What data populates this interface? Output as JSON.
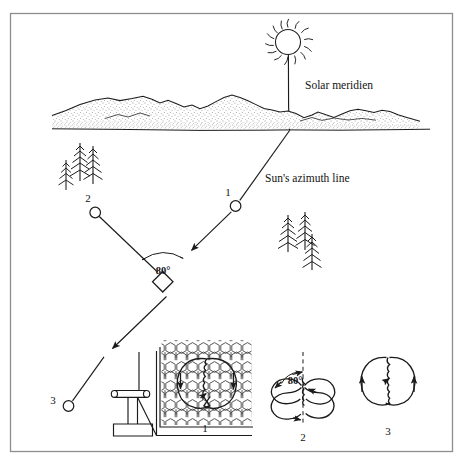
{
  "figure": {
    "title_text": "Solar meridien",
    "azimuth_text": "Sun's azimuth line",
    "angle_value": "80°",
    "border_color": "#8a8a8a",
    "ink_color": "#1b1b1b",
    "background_color": "#ffffff"
  },
  "annotations": {
    "solar_meridien": "Solar meridien",
    "suns_azimuth_line": "Sun's azimuth line",
    "angle_main": "80°",
    "angle_inset": "80°"
  },
  "stations": [
    {
      "id": "1",
      "label": "1"
    },
    {
      "id": "2",
      "label": "2"
    },
    {
      "id": "3",
      "label": "3"
    }
  ],
  "insets": [
    {
      "id": "inset-1",
      "label": "1",
      "caption": "1"
    },
    {
      "id": "inset-2",
      "label": "2",
      "caption": "2",
      "angle": "80°"
    },
    {
      "id": "inset-3",
      "label": "3",
      "caption": "3"
    }
  ],
  "scene": {
    "sun": "sun-icon",
    "horizon": "mountain-horizon",
    "trees_left": "conifer-tree-cluster",
    "trees_right": "conifer-tree-cluster",
    "instrument": "survey-instrument-icon",
    "vertex": "diamond-vertex-marker"
  }
}
